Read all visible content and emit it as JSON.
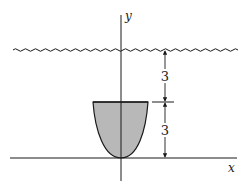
{
  "figure": {
    "type": "hydrostatic-plate-diagram",
    "colors": {
      "line": "#1a1a1a",
      "plate_fill": "#b8b8b8",
      "background": "#ffffff"
    }
  },
  "axes": {
    "x_label": "x",
    "y_label": "y"
  },
  "water_surface": {
    "label": "water-surface",
    "style": "wavy"
  },
  "plate": {
    "shape": "parabola",
    "height": 3
  },
  "dimensions": [
    {
      "name": "depth-to-plate-top",
      "label": "3"
    },
    {
      "name": "plate-height",
      "label": "3"
    }
  ]
}
